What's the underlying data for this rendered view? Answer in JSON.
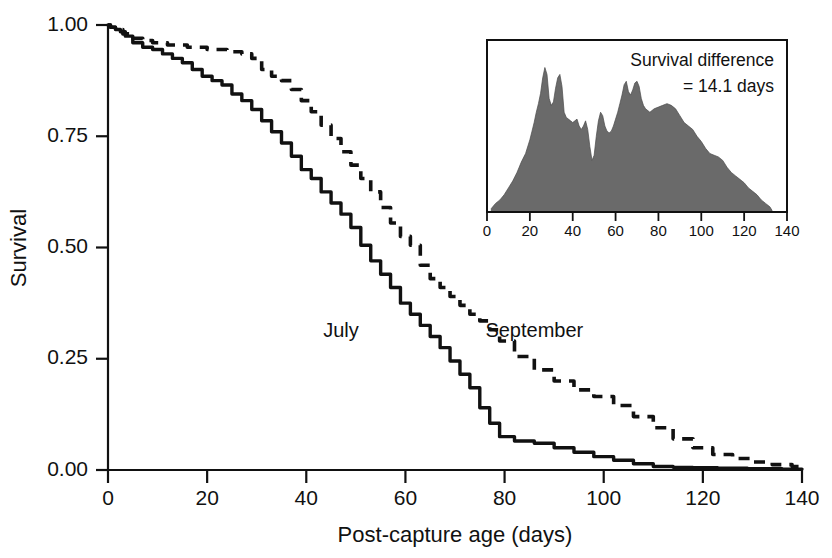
{
  "chart_data": {
    "type": "line",
    "title": "",
    "subtitle": "",
    "xlabel": "Post-capture age (days)",
    "ylabel": "Survival",
    "xlim": [
      0,
      140
    ],
    "ylim": [
      0,
      1
    ],
    "grid": false,
    "legend_position": "inline-annotations",
    "xticks": [
      0,
      20,
      40,
      60,
      80,
      100,
      120,
      140
    ],
    "xtick_labels": [
      "0",
      "20",
      "40",
      "60",
      "80",
      "100",
      "120",
      "140"
    ],
    "yticks": [
      0,
      0.25,
      0.5,
      0.75,
      1
    ],
    "ytick_labels": [
      "0.00",
      "0.25",
      "0.50",
      "0.75",
      "1.00"
    ],
    "series": [
      {
        "name": "July",
        "style": "solid",
        "color": "#111111",
        "label_x": 47,
        "label_y": 0.3,
        "x": [
          0,
          1,
          2,
          3,
          4,
          6,
          8,
          10,
          12,
          14,
          16,
          18,
          20,
          22,
          24,
          26,
          28,
          30,
          32,
          34,
          36,
          38,
          40,
          42,
          44,
          46,
          48,
          50,
          52,
          54,
          56,
          58,
          60,
          62,
          64,
          66,
          68,
          70,
          72,
          74,
          76,
          78,
          80,
          84,
          88,
          92,
          96,
          100,
          104,
          108,
          112,
          116,
          120,
          126,
          132,
          140
        ],
        "y": [
          1.0,
          0.995,
          0.99,
          0.985,
          0.975,
          0.96,
          0.95,
          0.945,
          0.935,
          0.925,
          0.915,
          0.9,
          0.885,
          0.875,
          0.865,
          0.845,
          0.83,
          0.81,
          0.785,
          0.76,
          0.735,
          0.705,
          0.675,
          0.655,
          0.625,
          0.6,
          0.575,
          0.545,
          0.505,
          0.47,
          0.44,
          0.41,
          0.375,
          0.35,
          0.325,
          0.3,
          0.275,
          0.245,
          0.215,
          0.185,
          0.14,
          0.105,
          0.075,
          0.065,
          0.06,
          0.05,
          0.04,
          0.03,
          0.022,
          0.014,
          0.008,
          0.006,
          0.005,
          0.004,
          0.003,
          0.002
        ]
      },
      {
        "name": "September",
        "style": "dashed",
        "color": "#111111",
        "label_x": 86,
        "label_y": 0.3,
        "x": [
          0,
          1,
          2,
          4,
          6,
          8,
          10,
          14,
          18,
          22,
          26,
          28,
          30,
          32,
          34,
          36,
          38,
          40,
          42,
          44,
          46,
          48,
          50,
          52,
          54,
          56,
          58,
          60,
          62,
          64,
          66,
          68,
          70,
          72,
          74,
          76,
          78,
          80,
          84,
          88,
          92,
          96,
          100,
          104,
          108,
          112,
          116,
          120,
          124,
          128,
          132,
          136,
          140
        ],
        "y": [
          1.0,
          0.995,
          0.99,
          0.98,
          0.97,
          0.965,
          0.96,
          0.955,
          0.95,
          0.945,
          0.94,
          0.935,
          0.925,
          0.9,
          0.885,
          0.875,
          0.855,
          0.83,
          0.805,
          0.775,
          0.745,
          0.715,
          0.685,
          0.655,
          0.625,
          0.59,
          0.555,
          0.525,
          0.505,
          0.46,
          0.43,
          0.41,
          0.39,
          0.37,
          0.35,
          0.335,
          0.315,
          0.29,
          0.255,
          0.225,
          0.2,
          0.18,
          0.165,
          0.145,
          0.12,
          0.095,
          0.07,
          0.05,
          0.035,
          0.026,
          0.018,
          0.012,
          0.008
        ]
      }
    ],
    "inset": {
      "type": "area",
      "annotation_line1": "Survival difference",
      "annotation_line2": "= 14.1 days",
      "xlim": [
        0,
        140
      ],
      "ylim": [
        0,
        1
      ],
      "xticks": [
        0,
        20,
        40,
        60,
        80,
        100,
        120,
        140
      ],
      "xtick_labels": [
        "0",
        "20",
        "40",
        "60",
        "80",
        "100",
        "120",
        "140"
      ],
      "fill_color": "#6a6a6a",
      "x": [
        2,
        4,
        6,
        8,
        10,
        12,
        14,
        16,
        18,
        20,
        21,
        22,
        23,
        24,
        25,
        26,
        27,
        28,
        29,
        30,
        31,
        32,
        33,
        34,
        35,
        36,
        37,
        38,
        39,
        40,
        41,
        42,
        43,
        44,
        45,
        46,
        47,
        48,
        49,
        50,
        51,
        52,
        53,
        54,
        55,
        56,
        57,
        58,
        59,
        60,
        61,
        62,
        63,
        64,
        65,
        66,
        67,
        68,
        69,
        70,
        71,
        72,
        73,
        74,
        76,
        78,
        80,
        82,
        84,
        86,
        88,
        90,
        92,
        94,
        96,
        98,
        100,
        102,
        104,
        106,
        108,
        110,
        112,
        114,
        116,
        118,
        120,
        122,
        124,
        126,
        128,
        130,
        132,
        133
      ],
      "y": [
        0.02,
        0.05,
        0.07,
        0.1,
        0.14,
        0.18,
        0.23,
        0.29,
        0.34,
        0.42,
        0.47,
        0.52,
        0.58,
        0.63,
        0.69,
        0.78,
        0.84,
        0.8,
        0.66,
        0.62,
        0.64,
        0.72,
        0.78,
        0.8,
        0.73,
        0.58,
        0.55,
        0.54,
        0.53,
        0.52,
        0.53,
        0.54,
        0.5,
        0.48,
        0.5,
        0.53,
        0.48,
        0.38,
        0.3,
        0.33,
        0.44,
        0.53,
        0.58,
        0.56,
        0.5,
        0.47,
        0.46,
        0.47,
        0.5,
        0.54,
        0.58,
        0.63,
        0.68,
        0.74,
        0.76,
        0.7,
        0.68,
        0.71,
        0.75,
        0.76,
        0.73,
        0.66,
        0.62,
        0.6,
        0.58,
        0.6,
        0.61,
        0.62,
        0.63,
        0.62,
        0.6,
        0.56,
        0.52,
        0.5,
        0.48,
        0.44,
        0.41,
        0.37,
        0.34,
        0.33,
        0.32,
        0.3,
        0.26,
        0.23,
        0.21,
        0.19,
        0.17,
        0.14,
        0.12,
        0.1,
        0.07,
        0.05,
        0.03,
        0.01
      ]
    }
  }
}
